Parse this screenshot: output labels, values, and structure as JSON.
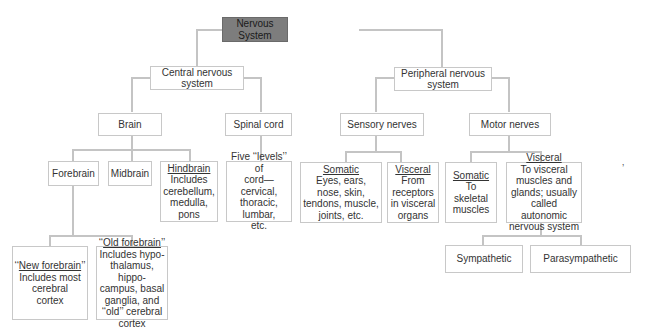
{
  "diagram": {
    "root": {
      "label": "Nervous System",
      "fill": "#7d7d7d"
    },
    "central": {
      "label": "Central nervous system",
      "line1": "Central nervous",
      "line2": "system",
      "brain": {
        "label": "Brain",
        "forebrain": {
          "label": "Forebrain",
          "new": {
            "title": "‘‘New forebrain’’",
            "title_open": "‘‘",
            "title_u": "New forebrain",
            "title_close": "’’",
            "desc1": "Includes most",
            "desc2": "cerebral",
            "desc3": "cortex"
          },
          "old": {
            "title_open": "‘‘",
            "title_u": "Old forebrain",
            "title_close": "’’",
            "desc1": "Includes hypo-",
            "desc2": "thalamus, hippo-",
            "desc3": "campus, basal",
            "desc4": "ganglia, and",
            "desc5": "‘‘old’’ cerebral",
            "desc6": "cortex"
          }
        },
        "midbrain": {
          "label": "Midbrain"
        },
        "hindbrain": {
          "title": "Hindbrain",
          "desc1": "Includes",
          "desc2": "cerebellum,",
          "desc3": "medulla,",
          "desc4": "pons"
        }
      },
      "spinal_cord": {
        "label": "Spinal cord",
        "desc1": "Five ‘‘levels’’ of",
        "desc2": "cord—cervical,",
        "desc3": "thoracic,",
        "desc4": "lumbar,",
        "desc5": "etc."
      }
    },
    "peripheral": {
      "line1": "Peripheral nervous",
      "line2": "system",
      "sensory": {
        "label": "Sensory nerves",
        "somatic": {
          "title": "Somatic",
          "desc1": "Eyes, ears,",
          "desc2": "nose, skin,",
          "desc3": "tendons, muscle,",
          "desc4": "joints, etc."
        },
        "visceral": {
          "title": "Visceral",
          "desc1": "From",
          "desc2": "receptors",
          "desc3": "in visceral",
          "desc4": "organs"
        }
      },
      "motor": {
        "label": "Motor nerves",
        "somatic": {
          "title": "Somatic",
          "desc1": "To",
          "desc2": "skeletal",
          "desc3": "muscles"
        },
        "visceral": {
          "title": "Visceral",
          "desc1": "To visceral",
          "desc2": "muscles and",
          "desc3": "glands; usually",
          "desc4": "called autonomic",
          "desc5": "nervous system"
        },
        "sympathetic": {
          "label": "Sympathetic"
        },
        "parasympathetic": {
          "label": "Parasympathetic"
        }
      }
    },
    "stray_mark": "’"
  }
}
